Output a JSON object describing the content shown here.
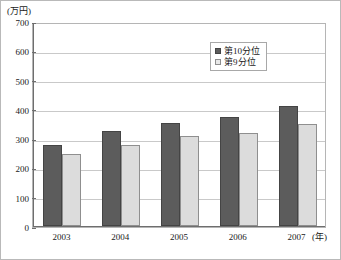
{
  "chart_data": {
    "type": "bar",
    "title": "",
    "subtitle": "",
    "xlabel": "(年)",
    "ylabel": "(万円)",
    "y_unit_label": "(万円)",
    "x_unit_label": "(年)",
    "categories": [
      "2003",
      "2004",
      "2005",
      "2006",
      "2007"
    ],
    "series": [
      {
        "name": "第10分位",
        "color": "#5c5c5c",
        "values": [
          278,
          324,
          352,
          371,
          411
        ]
      },
      {
        "name": "第9分位",
        "color": "#dcdcdc",
        "values": [
          245,
          278,
          307,
          316,
          347
        ]
      }
    ],
    "ylim": [
      0,
      700
    ],
    "ytick_step": 100,
    "yticks": [
      "0",
      "100",
      "200",
      "300",
      "400",
      "500",
      "600",
      "700"
    ],
    "grid": true,
    "grid_axis": "y",
    "legend_position": "top-right"
  },
  "legend": {
    "items": [
      {
        "label": "第10分位"
      },
      {
        "label": "第9分位"
      }
    ]
  }
}
